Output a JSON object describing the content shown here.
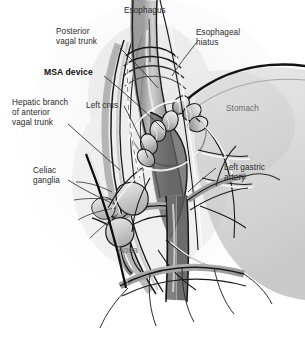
{
  "figure": {
    "style": "grayscale medical illustration",
    "background_color": "#fefefe",
    "label_color": "#2b2b2b",
    "ghost_label_color": "#6d6d6d"
  },
  "labels": [
    {
      "id": "esophagus",
      "text": "Esophagus",
      "bold": false,
      "leader": true
    },
    {
      "id": "esophageal_hiatus_l1",
      "text": "Esophageal",
      "bold": false,
      "leader": true
    },
    {
      "id": "esophageal_hiatus_l2",
      "text": "hiatus",
      "bold": false,
      "leader": false
    },
    {
      "id": "posterior_vagal_l1",
      "text": "Posterior",
      "bold": false,
      "leader": true
    },
    {
      "id": "posterior_vagal_l2",
      "text": "vagal trunk",
      "bold": false,
      "leader": false
    },
    {
      "id": "msa_device",
      "text": "MSA device",
      "bold": true,
      "leader": true
    },
    {
      "id": "hepatic_l1",
      "text": "Hepatic branch",
      "bold": false,
      "leader": true
    },
    {
      "id": "hepatic_l2",
      "text": "of anterior",
      "bold": false,
      "leader": false
    },
    {
      "id": "hepatic_l3",
      "text": "vagal trunk",
      "bold": false,
      "leader": false
    },
    {
      "id": "left_crus",
      "text": "Left crus",
      "bold": false,
      "leader": true
    },
    {
      "id": "stomach",
      "text": "Stomach",
      "bold": false,
      "leader": false
    },
    {
      "id": "celiac_l1",
      "text": "Celiac",
      "bold": false,
      "leader": true
    },
    {
      "id": "celiac_l2",
      "text": "ganglia",
      "bold": false,
      "leader": false
    },
    {
      "id": "left_gastric_l1",
      "text": "Left gastric",
      "bold": false,
      "leader": true
    },
    {
      "id": "left_gastric_l2",
      "text": "artery",
      "bold": false,
      "leader": false
    },
    {
      "id": "aorta",
      "text": "Aorta",
      "bold": false,
      "leader": false
    }
  ],
  "structures": [
    "esophagus",
    "esophageal hiatus",
    "diaphragmatic crus",
    "stomach fundus",
    "MSA bead ring device",
    "posterior vagal trunk",
    "anterior vagal trunk hepatic branch",
    "celiac ganglia",
    "left gastric artery",
    "aorta",
    "celiac trunk branches"
  ]
}
